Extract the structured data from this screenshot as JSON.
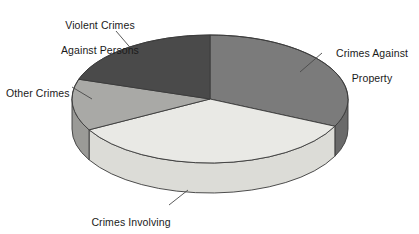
{
  "chart_data": {
    "type": "pie",
    "title": "",
    "subtitle": "",
    "xlabel": "",
    "ylabel": "",
    "grid": false,
    "legend_position": "callout-labels",
    "three_d": true,
    "categories": [
      "Crimes Against Property",
      "Crimes Involving Drugs",
      "Other Crimes",
      "Violent Crimes Against Persons"
    ],
    "values": [
      32,
      35,
      13,
      20
    ],
    "slices": [
      {
        "label": "Crimes Against Property",
        "label_line1": "Crimes Against",
        "label_line2": "Property",
        "value": 32,
        "start_angle": 0,
        "end_angle": 117,
        "color": "#7b7b7b",
        "side_color": "#6a6a6a"
      },
      {
        "label": "Crimes Involving Drugs",
        "label_line1": "Crimes Involving",
        "label_line2": "Drugs",
        "value": 35,
        "start_angle": 117,
        "end_angle": 243,
        "color": "#e9e9e5",
        "side_color": "#dcdcd7"
      },
      {
        "label": "Other Crimes",
        "label_line1": "Other Crimes",
        "label_line2": "",
        "value": 13,
        "start_angle": 243,
        "end_angle": 291,
        "color": "#a9a9a6",
        "side_color": "#9a9a97"
      },
      {
        "label": "Violent Crimes Against Persons",
        "label_line1": "Violent Crimes",
        "label_line2": "Against Persons",
        "value": 20,
        "start_angle": 291,
        "end_angle": 360,
        "color": "#4a4a4a",
        "side_color": "#3e3e3e"
      }
    ],
    "outline_color": "#3a3a3a",
    "background_color": "#ffffff",
    "text_color": "#1a1a1a"
  },
  "labels": {
    "violent": {
      "line1": "Violent Crimes",
      "line2": "Against Persons"
    },
    "property": {
      "line1": "Crimes Against",
      "line2": "Property"
    },
    "other": {
      "line1": "Other Crimes",
      "line2": ""
    },
    "drugs": {
      "line1": "Crimes Involving",
      "line2": "Drugs"
    }
  }
}
